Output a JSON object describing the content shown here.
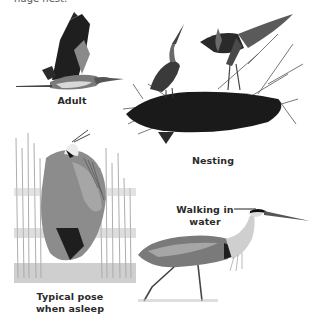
{
  "page": {
    "top_text_fragment": "huge nest."
  },
  "illustrations": [
    {
      "id": "adult",
      "subject": "heron-in-flight",
      "caption": "Adult"
    },
    {
      "id": "nesting",
      "subject": "herons-on-nest",
      "caption": "Nesting"
    },
    {
      "id": "asleep",
      "subject": "heron-sleeping-in-reeds",
      "caption_line1": "Typical pose",
      "caption_line2": "when asleep"
    },
    {
      "id": "walking",
      "subject": "heron-wading",
      "caption_line1": "Walking in",
      "caption_line2": "water"
    }
  ],
  "colors": {
    "background": "#ffffff",
    "ink_dark": "#1e1e1e",
    "ink_mid": "#6e6e6e",
    "ink_light": "#b8b8b8"
  }
}
